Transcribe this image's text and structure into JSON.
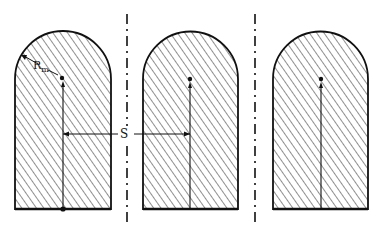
{
  "diagram": {
    "labels": {
      "radius_main": "R",
      "radius_sub": "m",
      "spacing": "S"
    },
    "shapes": [
      {
        "id": "rod-1",
        "left": 15,
        "right": 111,
        "center_x": 63,
        "dot_y": 77
      },
      {
        "id": "rod-2",
        "left": 143,
        "right": 238,
        "center_x": 190,
        "dot_y": 78
      },
      {
        "id": "rod-3",
        "left": 273,
        "right": 368,
        "center_x": 321,
        "dot_y": 78
      }
    ],
    "dividers": [
      127,
      255
    ],
    "colors": {
      "stroke": "#111111",
      "background": "#ffffff"
    }
  }
}
